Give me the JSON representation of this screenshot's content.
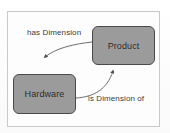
{
  "diagram": {
    "frame": {
      "border_color": "#c9c9c9",
      "background_color": "#fdfdfd"
    },
    "node_style": {
      "fill_color": "#9b9b9b",
      "border_color": "#4a4a4a",
      "text_color": "#1f1f1f"
    },
    "edge_style": {
      "stroke_color": "#6e6e6e"
    },
    "nodes": [
      {
        "id": "product",
        "label": "Product"
      },
      {
        "id": "hardware",
        "label": "Hardware"
      }
    ],
    "edges": [
      {
        "id": "has-dimension",
        "label": "has Dimension",
        "from": "Product",
        "to": "Hardware",
        "arrow": "down"
      },
      {
        "id": "is-dimension-of",
        "label": "is Dimension of",
        "from": "Hardware",
        "to": "Product",
        "arrow": "up"
      }
    ]
  }
}
